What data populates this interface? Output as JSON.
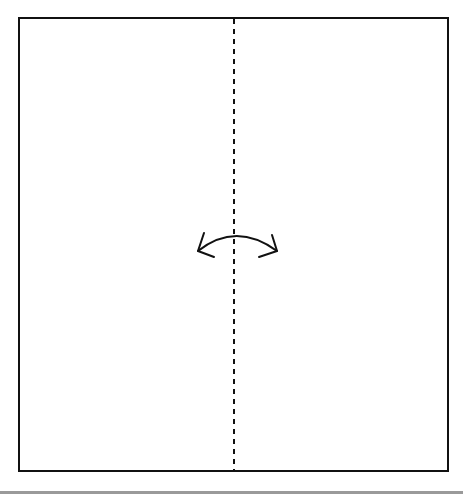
{
  "diagram": {
    "type": "origami-fold-instruction",
    "paper": {
      "shape": "square",
      "x": 19,
      "y": 18,
      "width": 429,
      "height": 453,
      "stroke": "#111111",
      "stroke_width": 2,
      "fill": "#ffffff"
    },
    "fold_line": {
      "style": "valley-fold-dashed",
      "x": 234,
      "y1": 18,
      "y2": 471,
      "dash": 5,
      "gap": 5,
      "stroke": "#111111"
    },
    "fold_arrow": {
      "icon": "two-way-curved-arrow-icon",
      "meaning": "fold and unfold along center line",
      "stroke": "#111111"
    },
    "bottom_rule": {
      "color": "#9a9a9a"
    }
  }
}
